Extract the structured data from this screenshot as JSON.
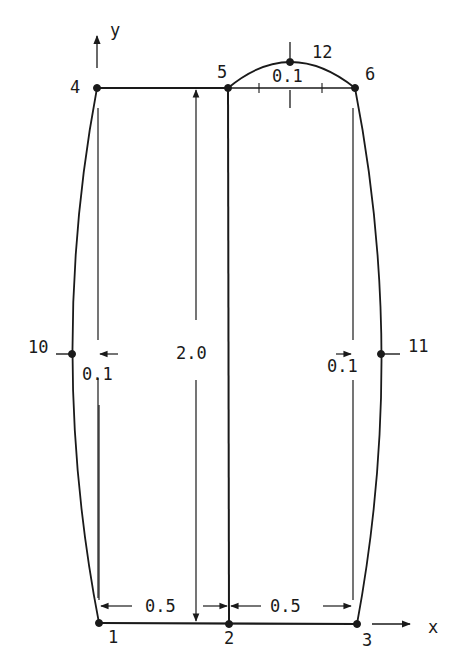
{
  "diagram": {
    "type": "finite-element-mesh",
    "axes": {
      "x_label": "x",
      "y_label": "y"
    },
    "nodes": [
      {
        "id": "1",
        "label": "1",
        "x": 99,
        "y": 623
      },
      {
        "id": "2",
        "label": "2",
        "x": 229,
        "y": 624
      },
      {
        "id": "3",
        "label": "3",
        "x": 357,
        "y": 624
      },
      {
        "id": "4",
        "label": "4",
        "x": 97,
        "y": 88
      },
      {
        "id": "5",
        "label": "5",
        "x": 228,
        "y": 88
      },
      {
        "id": "6",
        "label": "6",
        "x": 355,
        "y": 88
      },
      {
        "id": "10",
        "label": "10",
        "x": 72,
        "y": 354
      },
      {
        "id": "11",
        "label": "11",
        "x": 381,
        "y": 354
      },
      {
        "id": "12",
        "label": "12",
        "x": 290,
        "y": 62
      }
    ],
    "dimensions": {
      "height": "2.0",
      "bottom_left_width": "0.5",
      "bottom_right_width": "0.5",
      "left_bulge": "0.1",
      "right_bulge": "0.1",
      "top_bulge": "0.1"
    }
  }
}
